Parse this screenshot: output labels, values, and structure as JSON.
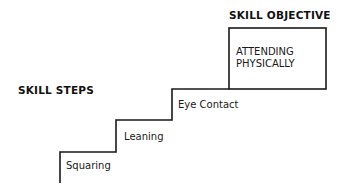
{
  "diagram": {
    "objective_heading": "SKILL OBJECTIVE",
    "objective_text_line1": "ATTENDING",
    "objective_text_line2": "PHYSICALLY",
    "steps_heading": "SKILL STEPS",
    "steps": [
      {
        "label": "Squaring"
      },
      {
        "label": "Leaning"
      },
      {
        "label": "Eye Contact"
      }
    ],
    "line_color": "#1a1a1a"
  }
}
